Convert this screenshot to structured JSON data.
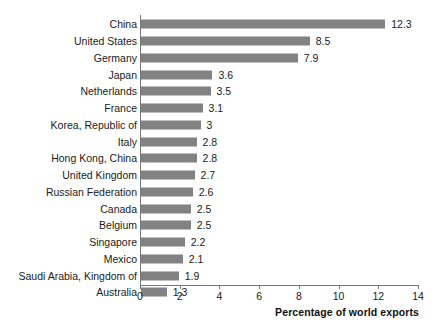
{
  "chart_data": {
    "type": "bar",
    "orientation": "horizontal",
    "title": "",
    "xlabel": "Percentage of world exports",
    "ylabel": "",
    "xlim": [
      0,
      14
    ],
    "xticks": [
      0,
      2,
      4,
      6,
      8,
      10,
      12,
      14
    ],
    "grid": false,
    "legend": null,
    "bar_color": "#828282",
    "axis_color": "#777777",
    "background_color": "#ffffff",
    "categories": [
      "China",
      "United States",
      "Germany",
      "Japan",
      "Netherlands",
      "France",
      "Korea, Republic of",
      "Italy",
      "Hong Kong, China",
      "United Kingdom",
      "Russian Federation",
      "Canada",
      "Belgium",
      "Singapore",
      "Mexico",
      "Saudi Arabia, Kingdom of",
      "Australia"
    ],
    "values": [
      12.3,
      8.5,
      7.9,
      3.6,
      3.5,
      3.1,
      3,
      2.8,
      2.8,
      2.7,
      2.6,
      2.5,
      2.5,
      2.2,
      2.1,
      1.9,
      1.3
    ],
    "value_labels": [
      "12.3",
      "8.5",
      "7.9",
      "3.6",
      "3.5",
      "3.1",
      "3",
      "2.8",
      "2.8",
      "2.7",
      "2.6",
      "2.5",
      "2.5",
      "2.2",
      "2.1",
      "1.9",
      "1.3"
    ],
    "xtick_labels": [
      "0",
      "2",
      "4",
      "6",
      "8",
      "10",
      "12",
      "14"
    ]
  }
}
